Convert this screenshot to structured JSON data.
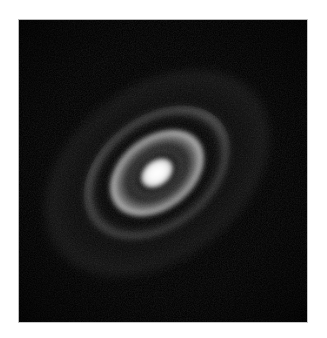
{
  "figure": {
    "domain": "Natural-Image",
    "description": "Greyscale astronomical continuum image of an inclined protoplanetary disk showing a bright unresolved central core surrounded by concentric bright dust rings separated by dark gaps, set on a black sky background inside a white page margin.",
    "colormap": "greyscale",
    "background_color": "#000000",
    "page_color": "#ffffff",
    "frame_color": "#bdbdbd"
  },
  "canvas": {
    "x": 19,
    "y": 20,
    "width": 288,
    "height": 302,
    "label": "sky-image"
  },
  "disk": {
    "center_x": 163,
    "center_y": 172,
    "position_angle_deg": -38,
    "inclination_note": "major axis runs lower-left to upper-right",
    "axis_ratio": 0.69,
    "brighter_side": "north-east"
  },
  "structures": [
    {
      "id": "core",
      "label": "central-core",
      "kind": "bright",
      "semi_major_px": 17,
      "semi_minor_px": 12,
      "peak_level": 255,
      "grey_hex": "#ffffff"
    },
    {
      "id": "gap-ab",
      "label": "inner-gap",
      "kind": "dark",
      "semi_major_px": 24,
      "semi_minor_px": 17,
      "peak_level": 20,
      "grey_hex": "#141414"
    },
    {
      "id": "ring-b",
      "label": "ring-B",
      "kind": "bright",
      "semi_major_px": 52,
      "semi_minor_px": 36,
      "peak_level": 225,
      "grey_hex": "#e1e1e1"
    },
    {
      "id": "gap-bc",
      "label": "gap-B-C",
      "kind": "dark",
      "semi_major_px": 59,
      "semi_minor_px": 41,
      "peak_level": 24,
      "grey_hex": "#181818"
    },
    {
      "id": "ring-c",
      "label": "ring-C",
      "kind": "bright",
      "semi_major_px": 80,
      "semi_minor_px": 55,
      "peak_level": 176,
      "grey_hex": "#b0b0b0"
    },
    {
      "id": "gap-cd",
      "label": "gap-C-D",
      "kind": "dark",
      "semi_major_px": 88,
      "semi_minor_px": 61,
      "peak_level": 18,
      "grey_hex": "#121212"
    },
    {
      "id": "ring-d",
      "label": "ring-D-outer",
      "kind": "bright",
      "semi_major_px": 106,
      "semi_minor_px": 73,
      "peak_level": 150,
      "grey_hex": "#969696"
    },
    {
      "id": "halo-outer",
      "label": "outer-dust-halo",
      "kind": "faint",
      "semi_major_px": 125,
      "semi_minor_px": 86,
      "peak_level": 78,
      "grey_hex": "#4e4e4e"
    }
  ]
}
